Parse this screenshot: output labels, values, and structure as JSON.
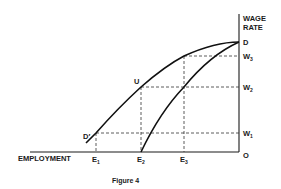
{
  "figure": {
    "caption": "Figure 4",
    "y_axis_label_line1": "WAGE",
    "y_axis_label_line2": "RATE",
    "x_axis_label": "EMPLOYMENT",
    "origin_label": "O",
    "point_labels": {
      "D": "D",
      "U": "U",
      "D_prime": "D′"
    },
    "wage_ticks": [
      {
        "base": "W",
        "sub": "3"
      },
      {
        "base": "W",
        "sub": "2"
      },
      {
        "base": "W",
        "sub": "1"
      }
    ],
    "employment_ticks": [
      {
        "base": "E",
        "sub": "1"
      },
      {
        "base": "E",
        "sub": "2"
      },
      {
        "base": "E",
        "sub": "3"
      }
    ],
    "colors": {
      "ink": "#1a1a1a",
      "background": "#ffffff"
    }
  }
}
